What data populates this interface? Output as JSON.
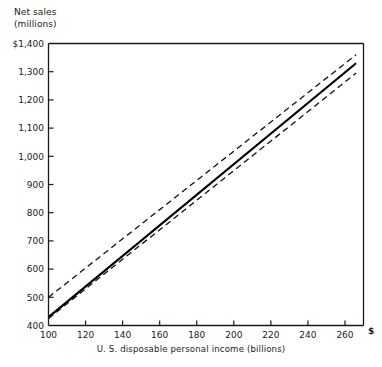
{
  "chart_data": {
    "type": "line",
    "title": "",
    "ylabel_lines": [
      "Net sales",
      "(millions)"
    ],
    "xlabel": "U. S. disposable personal income (billions)",
    "x_unit_symbol": "$",
    "xlim": [
      100,
      270
    ],
    "ylim": [
      400,
      1400
    ],
    "xticks": [
      100,
      120,
      140,
      160,
      180,
      200,
      220,
      240,
      260
    ],
    "xticklabels": [
      "100",
      "120",
      "140",
      "160",
      "180",
      "200",
      "220",
      "240",
      "260"
    ],
    "yticks": [
      400,
      500,
      600,
      700,
      800,
      900,
      1000,
      1100,
      1200,
      1300,
      1400
    ],
    "yticklabels": [
      "400",
      "500",
      "600",
      "700",
      "800",
      "900",
      "1,000",
      "1,100",
      "1,200",
      "1,300",
      "$1,400"
    ],
    "grid": false,
    "legend": null,
    "series": [
      {
        "name": "regression line",
        "style": "solid",
        "width": 2.2,
        "color": "#000000",
        "x": [
          100,
          266
        ],
        "values": [
          430,
          1330
        ]
      },
      {
        "name": "upper confidence band",
        "style": "dashed",
        "width": 1.3,
        "color": "#111111",
        "x": [
          100,
          266
        ],
        "values": [
          500,
          1360
        ]
      },
      {
        "name": "lower confidence band",
        "style": "dashed",
        "width": 1.3,
        "color": "#111111",
        "x": [
          100,
          266
        ],
        "values": [
          425,
          1295
        ]
      }
    ]
  },
  "axis": {
    "y_title_line1": "Net sales",
    "y_title_line2": "(millions)",
    "x_title": "U. S. disposable personal income (billions)",
    "x_currency": "$"
  }
}
